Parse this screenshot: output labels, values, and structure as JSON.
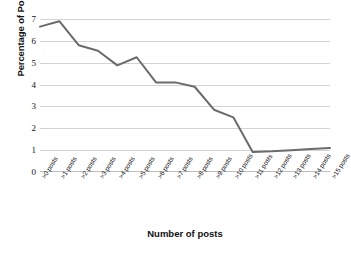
{
  "chart_data": {
    "type": "line",
    "title": "",
    "xlabel": "Number of posts",
    "ylabel": "Percentage of Posters",
    "categories": [
      ">0 posts",
      ">1 posts",
      ">2 posts",
      ">3 posts",
      ">4 posts",
      ">5 posts",
      ">6 posts",
      ">7 posts",
      ">8 posts",
      ">9 posts",
      ">10 posts",
      ">11 posts",
      ">12 posts",
      ">13 posts",
      ">14 posts",
      ">15 posts"
    ],
    "values": [
      6.65,
      6.9,
      5.8,
      5.55,
      4.88,
      5.25,
      4.1,
      4.1,
      3.9,
      2.85,
      2.5,
      0.92,
      0.95,
      1.0,
      1.05,
      1.1
    ],
    "series": [
      {
        "name": "Percentage of Posters",
        "values": [
          6.65,
          6.9,
          5.8,
          5.55,
          4.88,
          5.25,
          4.1,
          4.1,
          3.9,
          2.85,
          2.5,
          0.92,
          0.95,
          1.0,
          1.05,
          1.1
        ]
      }
    ],
    "ylim": [
      0,
      7
    ],
    "yticks": [
      0,
      1,
      2,
      3,
      4,
      5,
      6,
      7
    ],
    "ytick_labels": [
      "0",
      "1",
      "2",
      "3",
      "4",
      "5",
      "6",
      "7"
    ],
    "grid": true,
    "grid_axis": "y",
    "legend": false,
    "legend_position": "none",
    "line_color": "#6b6b6b",
    "grid_color": "#d4d4d4",
    "background_color": "#ffffff",
    "text_color": "#111111"
  }
}
